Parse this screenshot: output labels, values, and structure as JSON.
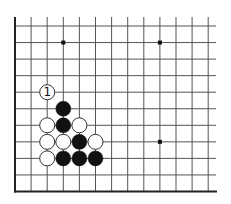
{
  "diagram": {
    "type": "go-board-fragment",
    "columns": 13,
    "rows": 11,
    "origin_x": 15,
    "origin_y": 26,
    "spacing_x": 16.1,
    "spacing_y": 16.55,
    "grid_top": 17,
    "grid_right": 216,
    "stone_radius": 7.5,
    "colors": {
      "line": "#555555",
      "border": "#222222",
      "black_stone": "#111111",
      "white_stone": "#ffffff",
      "white_stone_outline": "#333333",
      "star_point": "#111111"
    },
    "star_points": [
      {
        "col": 3,
        "row": 1
      },
      {
        "col": 9,
        "row": 1
      },
      {
        "col": 9,
        "row": 7
      }
    ],
    "stones": [
      {
        "col": 2,
        "row": 4,
        "color": "white",
        "label": "1"
      },
      {
        "col": 3,
        "row": 5,
        "color": "black",
        "label": ""
      },
      {
        "col": 2,
        "row": 6,
        "color": "white",
        "label": ""
      },
      {
        "col": 3,
        "row": 6,
        "color": "black",
        "label": ""
      },
      {
        "col": 4,
        "row": 6,
        "color": "white",
        "label": ""
      },
      {
        "col": 2,
        "row": 7,
        "color": "white",
        "label": ""
      },
      {
        "col": 3,
        "row": 7,
        "color": "white",
        "label": ""
      },
      {
        "col": 4,
        "row": 7,
        "color": "black",
        "label": ""
      },
      {
        "col": 5,
        "row": 7,
        "color": "white",
        "label": ""
      },
      {
        "col": 2,
        "row": 8,
        "color": "white",
        "label": ""
      },
      {
        "col": 3,
        "row": 8,
        "color": "black",
        "label": ""
      },
      {
        "col": 4,
        "row": 8,
        "color": "black",
        "label": ""
      },
      {
        "col": 5,
        "row": 8,
        "color": "black",
        "label": ""
      }
    ]
  }
}
